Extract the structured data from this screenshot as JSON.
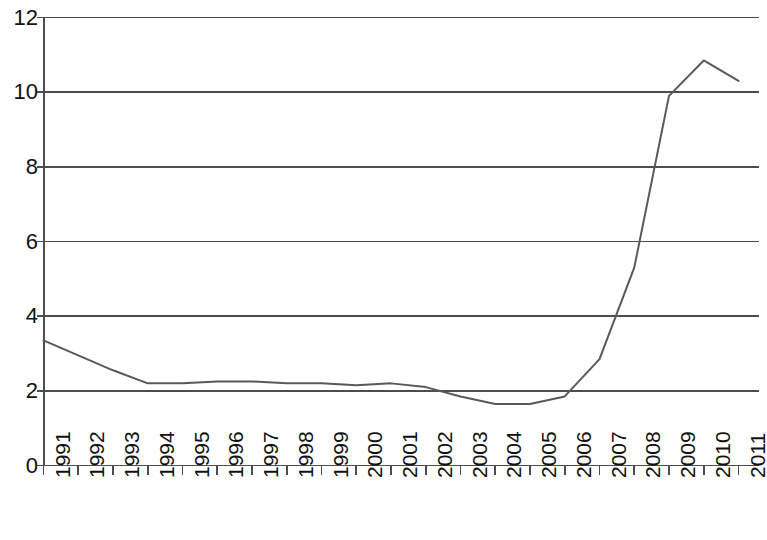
{
  "chart_data": {
    "type": "line",
    "title": "",
    "subtitle": "",
    "xlabel": "",
    "ylabel": "",
    "categories": [
      "1991",
      "1992",
      "1993",
      "1994",
      "1995",
      "1996",
      "1997",
      "1998",
      "1999",
      "2000",
      "2001",
      "2002",
      "2003",
      "2004",
      "2005",
      "2006",
      "2007",
      "2008",
      "2009",
      "2010",
      "2011"
    ],
    "values": [
      3.35,
      2.95,
      2.55,
      2.2,
      2.2,
      2.25,
      2.25,
      2.2,
      2.2,
      2.15,
      2.2,
      2.1,
      1.85,
      1.65,
      1.65,
      1.85,
      2.85,
      5.3,
      9.9,
      10.85,
      10.3
    ],
    "series": [
      {
        "name": "series-1",
        "color": "#595959",
        "values": [
          3.35,
          2.95,
          2.55,
          2.2,
          2.2,
          2.25,
          2.25,
          2.2,
          2.2,
          2.15,
          2.2,
          2.1,
          1.85,
          1.65,
          1.65,
          1.85,
          2.85,
          5.3,
          9.9,
          10.85,
          10.3
        ]
      }
    ],
    "ylim": [
      0,
      12
    ],
    "yticks": [
      0,
      2,
      4,
      6,
      8,
      10,
      12
    ],
    "ytick_labels": [
      "0",
      "2",
      "4",
      "6",
      "8",
      "10",
      "12"
    ],
    "grid": true,
    "grid_axis": "y",
    "grid_color": "#4d4d4d",
    "legend": false,
    "legend_position": "none",
    "xtick_rotation": -90,
    "axis_color": "#4d4d4d",
    "background": "#ffffff"
  },
  "axes": {
    "y_axis_label_0": "0",
    "y_axis_label_1": "2",
    "y_axis_label_2": "4",
    "y_axis_label_3": "6",
    "y_axis_label_4": "8",
    "y_axis_label_5": "10",
    "y_axis_label_6": "12"
  }
}
